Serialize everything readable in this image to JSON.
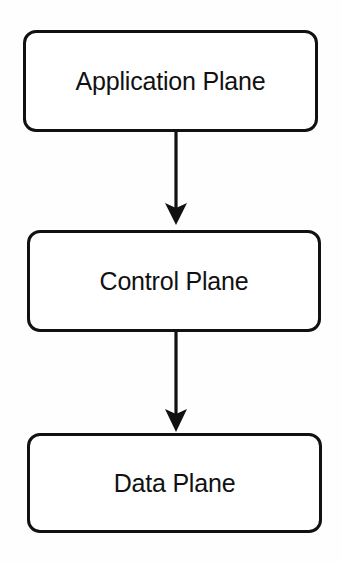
{
  "diagram": {
    "type": "vertical-flow",
    "background_color": "#fefefe",
    "stroke_color": "#111111",
    "fill_color": "#ffffff",
    "nodes": [
      {
        "id": "application",
        "label": "Application Plane",
        "shape": "rounded-rectangle",
        "order": 1
      },
      {
        "id": "control",
        "label": "Control Plane",
        "shape": "rounded-rectangle",
        "order": 2
      },
      {
        "id": "data",
        "label": "Data Plane",
        "shape": "rounded-rectangle",
        "order": 3
      }
    ],
    "connectors": [
      {
        "id": "app-to-control",
        "from": "application",
        "to": "control",
        "style": "solid-arrow",
        "direction": "down",
        "label": ""
      },
      {
        "id": "control-to-data",
        "from": "control",
        "to": "data",
        "style": "solid-arrow",
        "direction": "down",
        "label": ""
      }
    ]
  }
}
